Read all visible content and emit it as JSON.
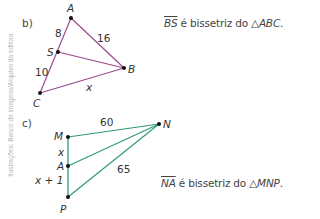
{
  "credit": "Ilustrações: Banco de imagens/Arquivo da editora",
  "colors": {
    "triangle_b": "#9a4b8c",
    "triangle_c": "#2e9a7c",
    "points": "#111111"
  },
  "part_b": {
    "label": "b)",
    "vertices": {
      "A": "A",
      "S": "S",
      "B": "B",
      "C": "C"
    },
    "measures": {
      "AS": "8",
      "AB": "16",
      "SC": "10",
      "CB": "x"
    },
    "caption": {
      "segment": "BS",
      "text": " é bissetriz do ",
      "triangle_symbol": "△",
      "triangle": "ABC",
      "end": "."
    }
  },
  "part_c": {
    "label": "c)",
    "vertices": {
      "M": "M",
      "A": "A",
      "P": "P",
      "N": "N"
    },
    "measures": {
      "MN": "60",
      "MA": "x",
      "AP": "x + 1",
      "NP": "65"
    },
    "caption": {
      "segment": "NA",
      "text": " é bissetriz do ",
      "triangle_symbol": "△",
      "triangle": "MNP",
      "end": "."
    }
  }
}
